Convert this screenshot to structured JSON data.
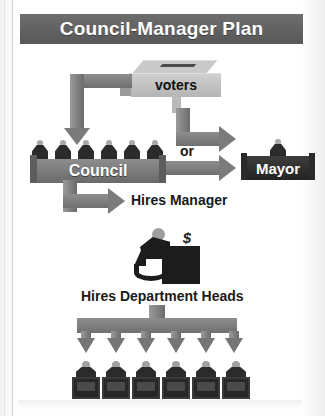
{
  "figure": {
    "title": "Council-Manager Plan",
    "nodes": {
      "voters": "voters",
      "council": "Council",
      "mayor": "Mayor",
      "or": "or"
    },
    "labels": {
      "hires_manager": "Hires Manager",
      "hires_department_heads": "Hires Department Heads"
    },
    "icons": {
      "ballot_box": "ballot-box-icon",
      "council_members": "council-member-icon",
      "mayor_figure": "mayor-figure-icon",
      "manager": "manager-at-desk-icon",
      "money": "dollar-sign-icon",
      "department_head": "department-head-icon"
    },
    "counts": {
      "council_members": 6,
      "department_heads": 6,
      "department_arrows": 6
    },
    "colors": {
      "title_bar": "#636363",
      "arrow": "#7b7b7b",
      "bench": "#7a7a7a",
      "mayor_bench": "#2b2b2b",
      "page": "#ffffff",
      "text_dark": "#1a1a1a",
      "text_light": "#ffffff"
    }
  }
}
